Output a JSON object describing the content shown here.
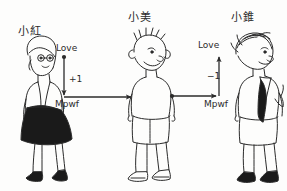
{
  "diagram": {
    "type": "caesar-cipher-illustration",
    "characters": [
      {
        "id": "left",
        "name": "小紅",
        "role": "sender",
        "description": "girl with short hair, white blouse, dark skirt, dark shoes"
      },
      {
        "id": "middle",
        "name": "小美",
        "role": "messenger",
        "description": "boy with spiky hair, white t-shirt, shorts, sandals"
      },
      {
        "id": "right",
        "name": "小錐",
        "role": "receiver",
        "description": "boy with messy hair, white shirt, dark tie, dark shoes"
      }
    ],
    "labels": {
      "plaintext": "Love",
      "ciphertext": "Mpwf",
      "encrypt_shift": "+1",
      "decrypt_shift": "−1"
    },
    "vertical_arrows": [
      {
        "id": "encrypt",
        "from": "Love",
        "to": "Mpwf",
        "direction": "down",
        "shift": "+1"
      },
      {
        "id": "decrypt",
        "from": "Mpwf",
        "to": "Love",
        "direction": "up",
        "shift": "−1"
      }
    ],
    "horizontal_arrows": [
      {
        "id": "transmit-left",
        "from": "小紅",
        "to": "小美",
        "direction": "right",
        "carries": "Mpwf"
      },
      {
        "id": "transmit-right",
        "from": "小美",
        "to": "小錐",
        "direction": "right",
        "carries": "Mpwf"
      }
    ],
    "colors": {
      "ink": "#2b2b2b",
      "paper": "#fdfdfc",
      "fill_dark": "#1a1a1a"
    }
  }
}
